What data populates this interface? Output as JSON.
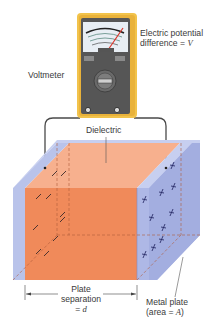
{
  "labels": {
    "voltage_line1": "Electric potential",
    "voltage_line2_prefix": "difference = ",
    "voltage_symbol": "V",
    "voltmeter": "Voltmeter",
    "dielectric": "Dielectric",
    "separation_line1": "Plate",
    "separation_line2": "separation",
    "separation_line3_prefix": "= ",
    "separation_symbol": "d",
    "plate_line1": "Metal plate",
    "plate_line2_prefix": "(area = ",
    "plate_symbol": "A",
    "plate_line2_suffix": ")"
  },
  "colors": {
    "voltmeter_body": "#f2c34b",
    "voltmeter_inner": "#4a4a4a",
    "meter_face": "#e8eef4",
    "needle": "#d9352a",
    "dielectric_front": "#f08a5a",
    "dielectric_top": "#f7b08e",
    "plate": "#b9c3ea",
    "plate_dark": "#9aa6dc",
    "wire": "#4a4a4a"
  },
  "charges": {
    "negative_symbol": "−",
    "positive_symbol": "+"
  }
}
